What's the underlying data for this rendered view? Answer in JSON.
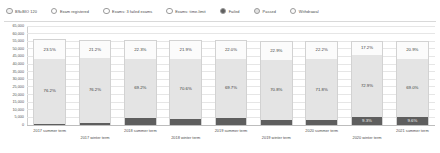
{
  "legend": {
    "items": [
      {
        "label": "BScBIO 120",
        "icon": "circle-swatch-icon",
        "color": "#f2f2f2"
      },
      {
        "label": "Exam registered",
        "icon": "circle-swatch-icon",
        "color": "#ffffff"
      },
      {
        "label": "Exams: 3 failed exams",
        "icon": "circle-swatch-icon",
        "color": "#ffffff"
      },
      {
        "label": "Exams: time-limit",
        "icon": "circle-swatch-icon",
        "color": "#ffffff"
      },
      {
        "label": "Failed",
        "icon": "circle-swatch-icon",
        "color": "#5e5e5e"
      },
      {
        "label": "Passed",
        "icon": "circle-swatch-icon",
        "color": "#e3e3e3"
      },
      {
        "label": "Withdrawal",
        "icon": "circle-swatch-icon",
        "color": "#fbfbfb"
      }
    ]
  },
  "chart_data": {
    "type": "bar",
    "title": "",
    "xlabel": "",
    "ylabel": "",
    "stacked": true,
    "stack_mode": "absolute",
    "grid": true,
    "legend_position": "top",
    "ylim": [
      0,
      65000
    ],
    "yticks": [
      0,
      5000,
      10000,
      15000,
      20000,
      25000,
      30000,
      35000,
      40000,
      45000,
      50000,
      55000,
      60000,
      65000
    ],
    "ytick_labels": [
      "0",
      "5,000",
      "10,000",
      "15,000",
      "20,000",
      "25,000",
      "30,000",
      "35,000",
      "40,000",
      "45,000",
      "50,000",
      "55,000",
      "60,000",
      "65,000"
    ],
    "categories": [
      "2017 summer term",
      "2017 winter term",
      "2018 summer term",
      "2018 winter term",
      "2019 summer term",
      "2019 winter term",
      "2020 summer term",
      "2020 winter term",
      "2021 summer term"
    ],
    "category_rows": [
      {
        "label": "2017 summer term",
        "row": 0
      },
      {
        "label": "2017 winter term",
        "row": 1
      },
      {
        "label": "2018 summer term",
        "row": 0
      },
      {
        "label": "2018 winter term",
        "row": 1
      },
      {
        "label": "2019 summer term",
        "row": 0
      },
      {
        "label": "2019 winter term",
        "row": 1
      },
      {
        "label": "2020 summer term",
        "row": 0
      },
      {
        "label": "2020 winter term",
        "row": 1
      },
      {
        "label": "2021 summer term",
        "row": 0
      }
    ],
    "series": [
      {
        "name": "Withdrawal",
        "color": "#fbfbfb",
        "values": [
          13100,
          11800,
          12400,
          12200,
          12200,
          12700,
          12300,
          9600,
          11600
        ]
      },
      {
        "name": "Passed",
        "color": "#e4e4e4",
        "values": [
          42500,
          42400,
          38500,
          39300,
          38700,
          39300,
          39800,
          40700,
          38300
        ]
      },
      {
        "name": "Failed",
        "color": "#5e5e5e",
        "values": [
          700,
          1400,
          4700,
          4200,
          4600,
          3300,
          3300,
          5200,
          5300
        ]
      }
    ],
    "bar_labels": [
      {
        "top": "23.5%",
        "middle": "76.2%",
        "bottom": ""
      },
      {
        "top": "21.2%",
        "middle": "76.2%",
        "bottom": ""
      },
      {
        "top": "22.3%",
        "middle": "69.2%",
        "bottom": ""
      },
      {
        "top": "21.9%",
        "middle": "70.6%",
        "bottom": ""
      },
      {
        "top": "22.0%",
        "middle": "69.7%",
        "bottom": ""
      },
      {
        "top": "22.9%",
        "middle": "70.8%",
        "bottom": ""
      },
      {
        "top": "22.2%",
        "middle": "71.8%",
        "bottom": ""
      },
      {
        "top": "17.2%",
        "middle": "72.9%",
        "bottom": "9.3%"
      },
      {
        "top": "20.9%",
        "middle": "69.0%",
        "bottom": "9.6%"
      }
    ]
  }
}
